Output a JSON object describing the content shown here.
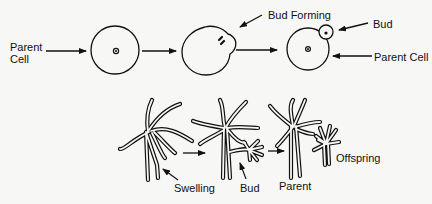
{
  "diagram": {
    "top_row": {
      "description": "Budding in a single cell",
      "labels": {
        "parent_cell_left_line1": "Parent",
        "parent_cell_left_line2": "Cell",
        "bud_forming": "Bud Forming",
        "bud": "Bud",
        "parent_cell_right": "Parent Cell"
      },
      "stages": [
        "parent-cell",
        "bud-forming",
        "bud-attached"
      ]
    },
    "bottom_row": {
      "description": "Budding in hydra",
      "labels": {
        "swelling": "Swelling",
        "bud": "Bud",
        "parent": "Parent",
        "offspring": "Offspring"
      },
      "stages": [
        "swelling",
        "bud",
        "parent-and-offspring"
      ]
    },
    "colors": {
      "background": "#f7f7f5",
      "ink": "#111111"
    }
  }
}
